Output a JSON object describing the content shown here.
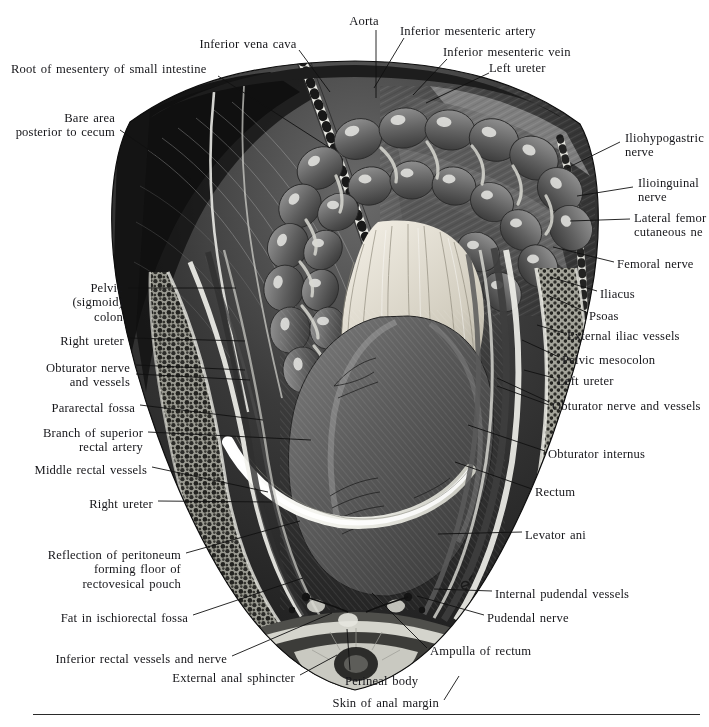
{
  "plate": {
    "title": "Dissection of the male pelvis and rectum, posterior view",
    "width": 709,
    "height": 727,
    "background_color": "#ffffff",
    "ink_color": "#16161a",
    "rule": {
      "x": 33,
      "y": 714,
      "width": 667
    }
  },
  "labels": [
    {
      "id": "aorta",
      "text": "Aorta",
      "align": "center",
      "x": 364,
      "y": 14,
      "lines": [
        "Aorta"
      ]
    },
    {
      "id": "inferior-vena-cava",
      "text": "Inferior vena cava",
      "align": "center",
      "x": 248,
      "y": 37,
      "lines": [
        "Inferior vena cava"
      ]
    },
    {
      "id": "inferior-mesenteric-artery",
      "text": "Inferior mesenteric artery",
      "align": "left",
      "x": 400,
      "y": 24,
      "lines": [
        "Inferior mesenteric artery"
      ]
    },
    {
      "id": "inferior-mesenteric-vein",
      "text": "Inferior mesenteric vein",
      "align": "left",
      "x": 443,
      "y": 45,
      "lines": [
        "Inferior mesenteric vein"
      ]
    },
    {
      "id": "left-ureter-top",
      "text": "Left ureter",
      "align": "left",
      "x": 489,
      "y": 61,
      "lines": [
        "Left ureter"
      ]
    },
    {
      "id": "root-of-mesentery",
      "text": "Root of mesentery of small intestine",
      "align": "left",
      "x": 11,
      "y": 62,
      "lines": [
        "Root of mesentery of small intestine"
      ]
    },
    {
      "id": "bare-area-cecum",
      "text": "Bare area posterior to cecum",
      "align": "right",
      "x": 115,
      "y": 111,
      "lines": [
        "Bare area",
        "posterior to cecum"
      ]
    },
    {
      "id": "iliohypogastric-nerve",
      "text": "Iliohypogastric nerve",
      "align": "left",
      "x": 625,
      "y": 131,
      "lines": [
        "Iliohypogastric",
        "nerve"
      ]
    },
    {
      "id": "ilioinguinal-nerve",
      "text": "Ilioinguinal nerve",
      "align": "left",
      "x": 638,
      "y": 176,
      "lines": [
        "Ilioinguinal",
        "nerve"
      ]
    },
    {
      "id": "lateral-femoral-cutaneous-nerve",
      "text": "Lateral femoral cutaneous nerve",
      "align": "left",
      "x": 634,
      "y": 211,
      "lines": [
        "Lateral femor",
        "cutaneous ne"
      ],
      "clipped": true
    },
    {
      "id": "femoral-nerve",
      "text": "Femoral nerve",
      "align": "left",
      "x": 617,
      "y": 257,
      "lines": [
        "Femoral nerve"
      ]
    },
    {
      "id": "iliacus",
      "text": "Iliacus",
      "align": "left",
      "x": 600,
      "y": 287,
      "lines": [
        "Iliacus"
      ]
    },
    {
      "id": "psoas",
      "text": "Psoas",
      "align": "left",
      "x": 589,
      "y": 309,
      "lines": [
        "Psoas"
      ]
    },
    {
      "id": "external-iliac-vessels",
      "text": "External iliac vessels",
      "align": "left",
      "x": 567,
      "y": 329,
      "lines": [
        "External iliac vessels"
      ]
    },
    {
      "id": "pelvic-mesocolon",
      "text": "Pelvic mesocolon",
      "align": "left",
      "x": 562,
      "y": 353,
      "lines": [
        "Pelvic mesocolon"
      ]
    },
    {
      "id": "left-ureter-mid",
      "text": "Left ureter",
      "align": "left",
      "x": 557,
      "y": 374,
      "lines": [
        "Left ureter"
      ]
    },
    {
      "id": "obturator-nerve-vessels-right",
      "text": "Obturator nerve and vessels",
      "align": "left",
      "x": 552,
      "y": 399,
      "lines": [
        "Obturator nerve and vessels"
      ]
    },
    {
      "id": "obturator-internus",
      "text": "Obturator internus",
      "align": "left",
      "x": 548,
      "y": 447,
      "lines": [
        "Obturator internus"
      ]
    },
    {
      "id": "rectum",
      "text": "Rectum",
      "align": "left",
      "x": 535,
      "y": 485,
      "lines": [
        "Rectum"
      ]
    },
    {
      "id": "levator-ani",
      "text": "Levator ani",
      "align": "left",
      "x": 525,
      "y": 528,
      "lines": [
        "Levator ani"
      ]
    },
    {
      "id": "internal-pudendal-vessels",
      "text": "Internal pudendal vessels",
      "align": "left",
      "x": 495,
      "y": 587,
      "lines": [
        "Internal pudendal vessels"
      ]
    },
    {
      "id": "pudendal-nerve",
      "text": "Pudendal nerve",
      "align": "left",
      "x": 487,
      "y": 611,
      "lines": [
        "Pudendal nerve"
      ]
    },
    {
      "id": "pelvic-sigmoid-colon",
      "text": "Pelvic (sigmoid) colon",
      "align": "right",
      "x": 123,
      "y": 281,
      "lines": [
        "Pelvic",
        "(sigmoid)",
        "colon"
      ]
    },
    {
      "id": "right-ureter-upper",
      "text": "Right ureter",
      "align": "right",
      "x": 124,
      "y": 334,
      "lines": [
        "Right ureter"
      ]
    },
    {
      "id": "obturator-nerve-vessels-left",
      "text": "Obturator nerve and vessels",
      "align": "right",
      "x": 130,
      "y": 361,
      "lines": [
        "Obturator nerve",
        "and vessels"
      ]
    },
    {
      "id": "pararectal-fossa",
      "text": "Pararectal fossa",
      "align": "right",
      "x": 135,
      "y": 401,
      "lines": [
        "Pararectal fossa"
      ]
    },
    {
      "id": "branch-superior-rectal-artery",
      "text": "Branch of superior rectal artery",
      "align": "right",
      "x": 143,
      "y": 426,
      "lines": [
        "Branch of superior",
        "rectal artery"
      ]
    },
    {
      "id": "middle-rectal-vessels",
      "text": "Middle rectal vessels",
      "align": "right",
      "x": 147,
      "y": 463,
      "lines": [
        "Middle rectal vessels"
      ]
    },
    {
      "id": "right-ureter-lower",
      "text": "Right ureter",
      "align": "right",
      "x": 153,
      "y": 497,
      "lines": [
        "Right ureter"
      ]
    },
    {
      "id": "reflection-of-peritoneum",
      "text": "Reflection of peritoneum forming floor of rectovesical pouch",
      "align": "right",
      "x": 181,
      "y": 548,
      "lines": [
        "Reflection of peritoneum",
        "forming floor of",
        "rectovesical pouch"
      ]
    },
    {
      "id": "fat-in-ischiorectal-fossa",
      "text": "Fat in ischiorectal fossa",
      "align": "right",
      "x": 188,
      "y": 611,
      "lines": [
        "Fat in ischiorectal fossa"
      ]
    },
    {
      "id": "inferior-rectal-vessels-nerve",
      "text": "Inferior rectal vessels and nerve",
      "align": "right",
      "x": 227,
      "y": 652,
      "lines": [
        "Inferior rectal vessels and nerve"
      ]
    },
    {
      "id": "external-anal-sphincter",
      "text": "External anal sphincter",
      "align": "right",
      "x": 295,
      "y": 671,
      "lines": [
        "External anal sphincter"
      ]
    },
    {
      "id": "skin-of-anal-margin",
      "text": "Skin of anal margin",
      "align": "right",
      "x": 439,
      "y": 696,
      "lines": [
        "Skin of anal margin"
      ]
    },
    {
      "id": "ampulla-of-rectum",
      "text": "Ampulla of rectum",
      "align": "left",
      "x": 430,
      "y": 644,
      "lines": [
        "Ampulla of rectum"
      ]
    },
    {
      "id": "perineal-body",
      "text": "Perineal body",
      "align": "left",
      "x": 345,
      "y": 674,
      "lines": [
        "Perineal body"
      ]
    }
  ],
  "leaders": [
    {
      "id": "leader-aorta",
      "points": "376,30 376,98"
    },
    {
      "id": "leader-inferior-vena-cava",
      "points": "299,50 330,92"
    },
    {
      "id": "leader-inferior-mesenteric-artery",
      "points": "404,38 374,88"
    },
    {
      "id": "leader-inferior-mesenteric-vein",
      "points": "447,59 413,95"
    },
    {
      "id": "leader-left-ureter-top",
      "points": "489,73 426,103"
    },
    {
      "id": "leader-root-of-mesentery",
      "points": "218,76 330,148"
    },
    {
      "id": "leader-bare-area-cecum",
      "points": "120,130 191,179"
    },
    {
      "id": "leader-iliohypogastric",
      "points": "620,142 567,168"
    },
    {
      "id": "leader-ilioinguinal",
      "points": "633,187 577,196"
    },
    {
      "id": "leader-lateral-femoral",
      "points": "630,219 570,221"
    },
    {
      "id": "leader-femoral-nerve",
      "points": "614,262 553,247"
    },
    {
      "id": "leader-iliacus",
      "points": "597,291 550,277"
    },
    {
      "id": "leader-psoas",
      "points": "586,312 547,295"
    },
    {
      "id": "leader-external-iliac",
      "points": "564,333 537,325"
    },
    {
      "id": "leader-pelvic-mesocolon",
      "points": "559,357 522,340"
    },
    {
      "id": "leader-left-ureter-mid",
      "points": "554,378 524,370"
    },
    {
      "id": "leader-obturator-right-a",
      "points": "549,402 497,378"
    },
    {
      "id": "leader-obturator-right-b",
      "points": "549,405 497,386"
    },
    {
      "id": "leader-obturator-internus",
      "points": "545,451 468,425"
    },
    {
      "id": "leader-rectum",
      "points": "532,489 455,462"
    },
    {
      "id": "leader-levator-ani",
      "points": "522,532 438,534"
    },
    {
      "id": "leader-internal-pudendal",
      "points": "492,591 434,589"
    },
    {
      "id": "leader-pudendal-nerve",
      "points": "484,615 417,596"
    },
    {
      "id": "leader-pelvic-sigmoid",
      "points": "128,288 236,288"
    },
    {
      "id": "leader-right-ureter-upper",
      "points": "129,338 245,341"
    },
    {
      "id": "leader-obturator-left-a",
      "points": "136,365 245,370"
    },
    {
      "id": "leader-obturator-left-b",
      "points": "136,374 250,380"
    },
    {
      "id": "leader-pararectal-fossa",
      "points": "140,405 263,420"
    },
    {
      "id": "leader-branch-sup-rectal",
      "points": "148,432 311,440"
    },
    {
      "id": "leader-middle-rectal",
      "points": "152,467 268,492"
    },
    {
      "id": "leader-right-ureter-lower",
      "points": "158,501 272,502"
    },
    {
      "id": "leader-reflection-peritoneum",
      "points": "186,553 300,521"
    },
    {
      "id": "leader-fat-ischiorectal",
      "points": "193,615 303,578"
    },
    {
      "id": "leader-inferior-rectal",
      "points": "232,656 332,613"
    },
    {
      "id": "leader-external-anal-sphincter",
      "points": "300,675 337,655"
    },
    {
      "id": "leader-skin-anal-margin",
      "points": "444,700 459,676"
    },
    {
      "id": "leader-ampulla-rectum",
      "points": "427,648 372,593"
    },
    {
      "id": "leader-perineal-body",
      "points": "350,670 347,629"
    }
  ],
  "icons": {
    "specimen": "anatomical-dissection-photograph"
  }
}
